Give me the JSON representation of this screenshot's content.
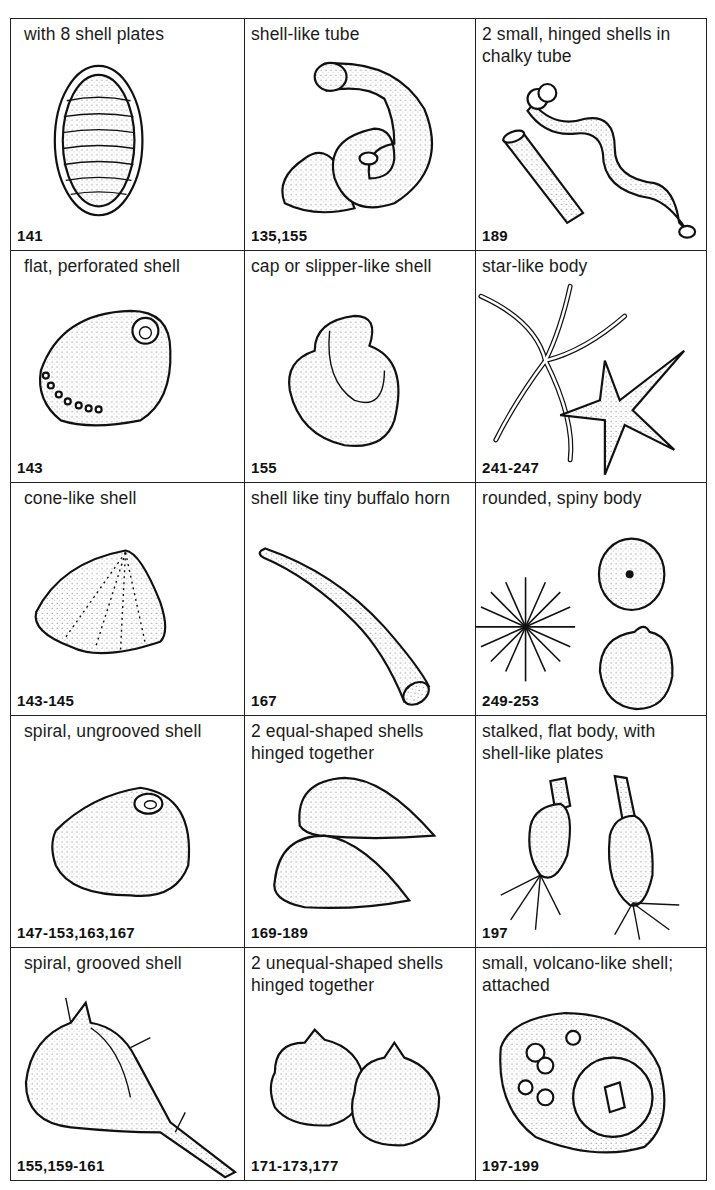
{
  "page": {
    "title": "",
    "grid": {
      "columns": 3,
      "rows": 5,
      "cells": [
        {
          "description": "with 8 shell plates",
          "refs": "141",
          "icon": "chiton-icon"
        },
        {
          "description": "shell-like tube",
          "refs": "135,155",
          "icon": "coiled-tube-worm-icon"
        },
        {
          "description": "2 small, hinged shells in chalky tube",
          "refs": "189",
          "icon": "shipworm-icon"
        },
        {
          "description": "flat, perforated shell",
          "refs": "143",
          "icon": "abalone-icon"
        },
        {
          "description": "cap or slipper-like shell",
          "refs": "155",
          "icon": "slipper-shell-icon"
        },
        {
          "description": "star-like body",
          "refs": "241-247",
          "icon": "starfish-icon"
        },
        {
          "description": "cone-like shell",
          "refs": "143-145",
          "icon": "limpet-icon"
        },
        {
          "description": "shell like tiny buffalo horn",
          "refs": "167",
          "icon": "tusk-shell-icon"
        },
        {
          "description": "rounded, spiny body",
          "refs": "249-253",
          "icon": "sea-urchin-icon"
        },
        {
          "description": "spiral, ungrooved shell",
          "refs": "147-153,163,167",
          "icon": "smooth-snail-icon"
        },
        {
          "description": "2 equal-shaped shells hinged together",
          "refs": "169-189",
          "icon": "mussel-icon"
        },
        {
          "description": "stalked, flat body, with shell-like plates",
          "refs": "197",
          "icon": "goose-barnacle-icon"
        },
        {
          "description": "spiral, grooved shell",
          "refs": "155,159-161",
          "icon": "murex-icon"
        },
        {
          "description": "2 unequal-shaped shells hinged together",
          "refs": "171-173,177",
          "icon": "oyster-icon"
        },
        {
          "description": "small, volcano-like shell; attached",
          "refs": "197-199",
          "icon": "acorn-barnacle-icon"
        }
      ]
    }
  }
}
